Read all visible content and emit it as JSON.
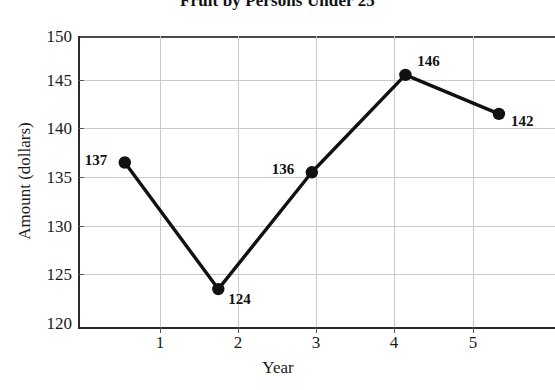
{
  "chart_data": {
    "type": "line",
    "title": "Fruit by Persons Under 25",
    "xlabel": "Year",
    "ylabel": "Amount (dollars)",
    "x": [
      1,
      2,
      3,
      4,
      5
    ],
    "values": [
      137,
      124,
      136,
      146,
      142
    ],
    "point_labels": [
      "137",
      "124",
      "136",
      "146",
      "142"
    ],
    "xtick_labels": [
      "1",
      "2",
      "3",
      "4",
      "5"
    ],
    "ytick_labels": [
      "120",
      "125",
      "130",
      "135",
      "140",
      "145",
      "150"
    ],
    "ytick_values": [
      120,
      125,
      130,
      135,
      140,
      145,
      150
    ],
    "xlim": [
      0.5,
      5.6
    ],
    "ylim": [
      120,
      150
    ],
    "grid": true,
    "legend": "none",
    "line_color": "#111111",
    "marker_color": "#111111",
    "grid_color": "#c9c9c9",
    "axis_color": "#2b2b2b",
    "background_color": "#ffffff"
  }
}
